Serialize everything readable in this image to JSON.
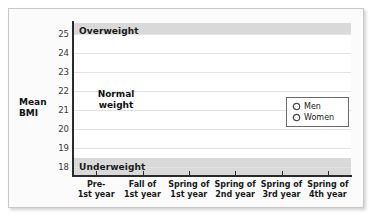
{
  "chart_data": {
    "type": "line",
    "title": "",
    "xlabel": "",
    "ylabel": "Mean BMI",
    "ylim": [
      17.6,
      25.6
    ],
    "yticks": [
      25,
      24,
      23,
      22,
      21,
      20,
      19,
      18
    ],
    "grid": true,
    "legend_position": "center-right",
    "categories": [
      "Pre-\n1st year",
      "Fall of\n1st year",
      "Spring of\n1st year",
      "Spring of\n2nd year",
      "Spring of\n3rd year",
      "Spring of\n4th year"
    ],
    "category_lines": [
      [
        "Pre-",
        "1st year"
      ],
      [
        "Fall of",
        "1st year"
      ],
      [
        "Spring of",
        "1st year"
      ],
      [
        "Spring of",
        "2nd year"
      ],
      [
        "Spring of",
        "3rd year"
      ],
      [
        "Spring of",
        "4th year"
      ]
    ],
    "series": [
      {
        "name": "Men",
        "values": [
          23.0,
          23.3,
          23.55,
          23.4,
          23.5,
          24.0
        ],
        "color": "#6e6e6e"
      },
      {
        "name": "Women",
        "values": [
          22.05,
          22.55,
          22.7,
          22.55,
          23.05,
          23.1
        ],
        "color": "#6e6e6e"
      }
    ],
    "bands": [
      {
        "name": "Overweight",
        "label": "Overweight",
        "from": 25.0,
        "to": 25.6,
        "color": "#d9d9d9"
      },
      {
        "name": "Normal weight",
        "label": "Normal weight",
        "from": 18.5,
        "to": 25.0,
        "color": "#ffffff"
      },
      {
        "name": "Underweight",
        "label": "Underweight",
        "from": 17.6,
        "to": 18.5,
        "color": "#d9d9d9"
      }
    ],
    "annotations": [
      {
        "name": "normal-weight-range",
        "text_lines": [
          "Normal",
          "weight"
        ],
        "text": "Normal weight",
        "arrow": "double-headed-vertical",
        "from": 18.5,
        "to": 25.0
      }
    ]
  },
  "axis": {
    "y_title_lines": [
      "Mean",
      "BMI"
    ],
    "y_tick_labels": [
      "25",
      "24",
      "23",
      "22",
      "21",
      "20",
      "19",
      "18"
    ]
  },
  "bands": {
    "overweight_label": "Overweight",
    "underweight_label": "Underweight"
  },
  "annotation": {
    "line1": "Normal",
    "line2": "weight"
  },
  "legend": {
    "items": [
      {
        "label": "Men",
        "icon": "circle-marker-icon"
      },
      {
        "label": "Women",
        "icon": "circle-marker-icon"
      }
    ]
  }
}
